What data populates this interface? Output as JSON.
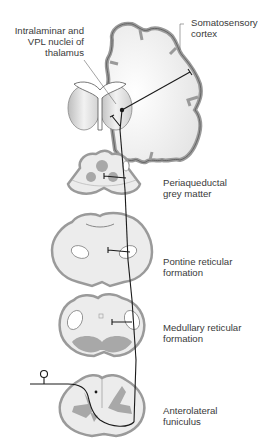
{
  "labels": {
    "thalamus": [
      "Intralaminar and",
      "VPL nuclei of",
      "thalamus"
    ],
    "cortex": [
      "Somatosensory",
      "cortex"
    ],
    "periaqueductal": [
      "Periaqueductal",
      "grey matter"
    ],
    "pontine": [
      "Pontine reticular",
      "formation"
    ],
    "medullary": [
      "Medullary reticular",
      "formation"
    ],
    "anterolateral": [
      "Anterolateral",
      "funiculus"
    ]
  },
  "colors": {
    "tissue_fill": "#ececec",
    "tissue_edge": "#9a9a9a",
    "grey_matter": "#a8a8a8",
    "pathway": "#1a1a1a",
    "text": "#3a3a3a"
  }
}
